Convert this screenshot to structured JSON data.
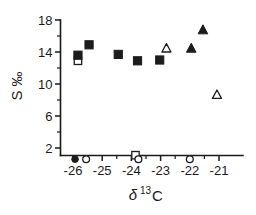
{
  "chart_data": {
    "type": "scatter",
    "title": "",
    "xlabel": "δ 13 C",
    "xlabel_base": "δ",
    "xlabel_sup": "13",
    "xlabel_tail": "C",
    "ylabel": "S ‰",
    "grid": false,
    "legend": "none",
    "xlim": [
      -26.6,
      -20.6
    ],
    "ylim": [
      0.3,
      18.6
    ],
    "xticks": [
      -26,
      -25,
      -24,
      -23,
      -22,
      -21
    ],
    "xtick_labels": [
      "-26",
      "-25",
      "-24",
      "-23",
      "-22",
      "-21"
    ],
    "xminor_ticks": [
      -25.5,
      -24.5,
      -23.5,
      -22.5,
      -21.5
    ],
    "yticks": [
      2,
      6,
      10,
      14,
      18
    ],
    "ytick_labels": [
      "2",
      "6",
      "10",
      "14",
      "18"
    ],
    "yminor_ticks": [
      4,
      8,
      12,
      16
    ],
    "series": [
      {
        "name": "filled-square",
        "marker": "filled-square",
        "color": "#1c1c1c",
        "points": [
          {
            "x": -25.83,
            "y": 13.6
          },
          {
            "x": -25.45,
            "y": 14.9
          },
          {
            "x": -24.45,
            "y": 13.7
          },
          {
            "x": -23.79,
            "y": 12.9
          },
          {
            "x": -23.03,
            "y": 13.0
          }
        ]
      },
      {
        "name": "open-square",
        "marker": "open-square",
        "color": "#1c1c1c",
        "points": [
          {
            "x": -25.83,
            "y": 12.9
          },
          {
            "x": -23.86,
            "y": 1.1
          }
        ]
      },
      {
        "name": "filled-triangle",
        "marker": "filled-triangle",
        "color": "#1c1c1c",
        "points": [
          {
            "x": -21.95,
            "y": 14.4
          },
          {
            "x": -21.55,
            "y": 16.7
          }
        ]
      },
      {
        "name": "open-triangle",
        "marker": "open-triangle",
        "color": "#1c1c1c",
        "points": [
          {
            "x": -22.8,
            "y": 14.4
          },
          {
            "x": -21.07,
            "y": 8.6
          }
        ]
      },
      {
        "name": "filled-circle",
        "marker": "filled-circle",
        "color": "#1c1c1c",
        "points": [
          {
            "x": -25.93,
            "y": 0.6
          }
        ]
      },
      {
        "name": "open-circle",
        "marker": "open-circle",
        "color": "#1c1c1c",
        "points": [
          {
            "x": -25.55,
            "y": 0.6
          },
          {
            "x": -23.76,
            "y": 0.6
          },
          {
            "x": -22.0,
            "y": 0.6
          }
        ]
      }
    ]
  },
  "axes": {
    "y_title": "S ‰",
    "x_title_base": "δ",
    "x_title_sup": "13",
    "x_title_tail": "C"
  }
}
